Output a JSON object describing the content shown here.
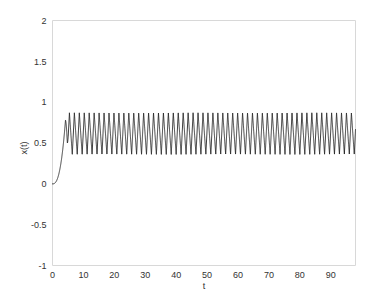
{
  "chart_data": {
    "type": "line",
    "title": "",
    "subtitle": "",
    "xlabel": "t",
    "ylabel": "x(t)",
    "xlim": [
      0,
      98
    ],
    "ylim": [
      -1,
      2
    ],
    "grid": false,
    "legend": null,
    "legend_position": "none",
    "xticks": [
      0,
      10,
      20,
      30,
      40,
      50,
      60,
      70,
      80,
      90
    ],
    "xtick_labels": [
      "0",
      "10",
      "20",
      "30",
      "40",
      "50",
      "60",
      "70",
      "80",
      "90"
    ],
    "yticks": [
      -1,
      -0.5,
      0,
      0.5,
      1,
      1.5,
      2
    ],
    "ytick_labels": [
      "-1",
      "-0.5",
      "0",
      "0.5",
      "1",
      "1.5",
      "2"
    ],
    "series": [
      {
        "name": "x(t)",
        "color": "#1a1a1a",
        "line_width": 0.85,
        "description": "Relaxation-oscillator response: starts at x=0, rises smoothly through a transient until about t=4, then settles into a sustained periodic oscillation of roughly constant amplitude for the rest of the record.",
        "transient": {
          "t_start": 0,
          "t_end": 4.2,
          "x_start": 0.0,
          "x_end": 0.78,
          "shape": "slow-then-steep sigmoid rise"
        },
        "limit_cycle": {
          "t_start": 4.2,
          "t_end": 98,
          "peak": 0.87,
          "trough": 0.36,
          "mean": 0.615,
          "amplitude": 0.255,
          "period": 1.6,
          "cycles": 59,
          "waveform": "asymmetric sawtooth: fast rise to peak, slightly slower fall to trough"
        }
      }
    ]
  },
  "axes": {
    "x_axis_label": "t",
    "y_axis_label": "x(t)"
  },
  "figure": {
    "background_color": "#ffffff",
    "frame_color": "#d8d8d8",
    "text_color": "#333333"
  }
}
